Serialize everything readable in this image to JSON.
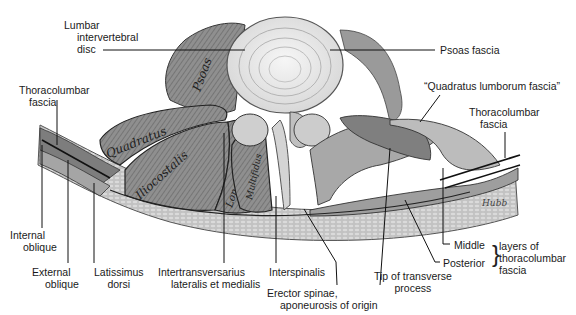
{
  "figure": {
    "colors": {
      "ink": "#1a1a1a",
      "tissue_dark": "#6e6e6e",
      "tissue_mid": "#9a9a9a",
      "tissue_light": "#cfcfcf",
      "disc": "#ededed",
      "background": "#ffffff"
    },
    "muscle_labels": {
      "psoas": "Psoas",
      "quadratus": "Quadratus",
      "iliocostalis": "Iliocostalis",
      "longissimus": "Longissimus",
      "multifidus": "Multifidus"
    },
    "signature": "Hubb"
  },
  "labels": {
    "lumbar_disc": [
      "Lumbar",
      "intervertebral",
      "disc"
    ],
    "psoas_fascia": [
      "Psoas fascia"
    ],
    "quadratus_fascia": [
      "“Quadratus lumborum fascia”"
    ],
    "thoracolumbar_left": [
      "Thoracolumbar",
      "fascia"
    ],
    "thoracolumbar_right": [
      "Thoracolumbar",
      "fascia"
    ],
    "internal_oblique": [
      "Internal",
      "oblique"
    ],
    "external_oblique": [
      "External",
      "oblique"
    ],
    "latissimus": [
      "Latissimus",
      "dorsi"
    ],
    "intertransversarius": [
      "Intertransversarius",
      "lateralis et medialis"
    ],
    "interspinalis": [
      "Interspinalis"
    ],
    "erector_spinae": [
      "Erector spinae,",
      "aponeurosis of origin"
    ],
    "tip_transverse": [
      "Tip of transverse",
      "process"
    ],
    "middle": [
      "Middle"
    ],
    "posterior": [
      "Posterior"
    ],
    "layers_of": [
      "layers of",
      "thoracolumbar",
      "fascia"
    ]
  }
}
